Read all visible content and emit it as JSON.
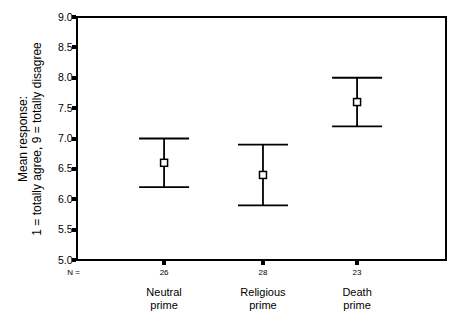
{
  "chart_data": {
    "type": "errorbar",
    "title": "",
    "ylabel_lines": [
      "Mean response:",
      "1 = totally agree, 9 = totally disagree"
    ],
    "xlabel": "",
    "ylim": [
      5.0,
      9.0
    ],
    "ytick_step": 0.5,
    "ytick_labels": [
      "9.0",
      "8.5",
      "8.0",
      "7.5",
      "7.0",
      "6.5",
      "6.0",
      "5.5",
      "5.0"
    ],
    "n_row_label": "N =",
    "categories": [
      {
        "label_lines": [
          "Neutral",
          "prime"
        ],
        "n": "26",
        "mean": 6.6,
        "ci_low": 6.2,
        "ci_high": 7.0
      },
      {
        "label_lines": [
          "Religious",
          "prime"
        ],
        "n": "28",
        "mean": 6.4,
        "ci_low": 5.9,
        "ci_high": 6.9
      },
      {
        "label_lines": [
          "Death",
          "prime"
        ],
        "n": "23",
        "mean": 7.6,
        "ci_low": 7.2,
        "ci_high": 8.0
      }
    ],
    "grid": false,
    "legend": null,
    "colors": {
      "stroke": "#000000",
      "marker_fill": "#ffffff",
      "background": "#ffffff"
    },
    "layout": {
      "plot": {
        "left": 77,
        "top": 17,
        "right": 446,
        "bottom": 260
      },
      "x_fractions": [
        0.236,
        0.504,
        0.759
      ],
      "cap_half_width": 25,
      "marker_size": 7,
      "errorbar_stroke_width": 1.8,
      "frame_stroke_width": 2,
      "n_row_y": 275,
      "category_line1_y": 296,
      "category_line2_y": 309
    }
  }
}
